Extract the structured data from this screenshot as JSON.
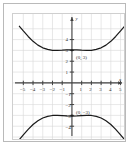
{
  "figure": {
    "kind": "coordinate-plane-graph",
    "curve_color": "#1a1a1a",
    "axis_color": "#404040",
    "grid_color": "#d8d8d8",
    "frame_color": "#b9b9b9",
    "background": "#ffffff"
  },
  "axes": {
    "x_label": "x",
    "y_label": "y",
    "x_ticks": [
      "-5",
      "-4",
      "-3",
      "-2",
      "-1",
      "1",
      "2",
      "3",
      "4",
      "5"
    ],
    "y_ticks": [
      "4",
      "3",
      "2",
      "1",
      "-1",
      "-2",
      "-3",
      "-4"
    ]
  },
  "annotations": {
    "upper_vertex": "(0, 3)",
    "lower_vertex": "(0, −3)"
  },
  "chart_data": {
    "type": "line",
    "title": "",
    "xlabel": "x",
    "ylabel": "y",
    "xlim": [
      -5.5,
      5.5
    ],
    "ylim": [
      -5.2,
      5.2
    ],
    "grid": true,
    "legend": "none",
    "xticks": [
      -5,
      -4,
      -3,
      -2,
      -1,
      1,
      2,
      3,
      4,
      5
    ],
    "yticks": [
      4,
      3,
      2,
      1,
      -1,
      -2,
      -3,
      -4
    ],
    "annotations": [
      {
        "text": "(0, 3)",
        "x": 0,
        "y": 3
      },
      {
        "text": "(0, −3)",
        "x": 0,
        "y": -3
      }
    ],
    "series": [
      {
        "name": "upper branch",
        "x": [
          -5.4,
          -5.0,
          -4.5,
          -4.0,
          -3.5,
          -3.0,
          -2.5,
          -2.0,
          -1.5,
          -1.0,
          -0.5,
          0,
          0.5,
          1.0,
          1.5,
          2.0,
          2.5,
          3.0,
          3.5,
          4.0,
          4.5,
          5.0,
          5.4
        ],
        "y": [
          5.23,
          4.8,
          4.29,
          3.84,
          3.49,
          3.24,
          3.09,
          3.01,
          3.0,
          3.02,
          3.05,
          3.06,
          3.05,
          3.02,
          3.0,
          3.01,
          3.09,
          3.24,
          3.49,
          3.84,
          4.29,
          4.8,
          5.23
        ]
      },
      {
        "name": "lower branch",
        "x": [
          -5.4,
          -5.0,
          -4.5,
          -4.0,
          -3.5,
          -3.0,
          -2.5,
          -2.0,
          -1.5,
          -1.0,
          -0.5,
          0,
          0.5,
          1.0,
          1.5,
          2.0,
          2.5,
          3.0,
          3.5,
          4.0,
          4.5,
          5.0,
          5.4
        ],
        "y": [
          -5.23,
          -4.8,
          -4.29,
          -3.84,
          -3.49,
          -3.24,
          -3.09,
          -3.01,
          -3.0,
          -3.02,
          -3.05,
          -3.06,
          -3.05,
          -3.02,
          -3.0,
          -3.01,
          -3.09,
          -3.24,
          -3.49,
          -3.84,
          -4.29,
          -4.8,
          -5.23
        ]
      }
    ]
  }
}
